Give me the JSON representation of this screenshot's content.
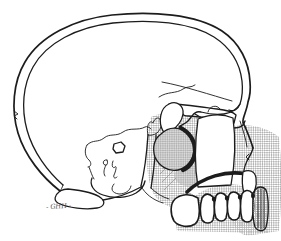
{
  "figure": {
    "signature": "- GHH -",
    "colors": {
      "ink": "#1c1c1c",
      "halftone": "#b4b4b4",
      "soft_shade": "#d9d9d9",
      "paper": "#ffffff"
    }
  }
}
